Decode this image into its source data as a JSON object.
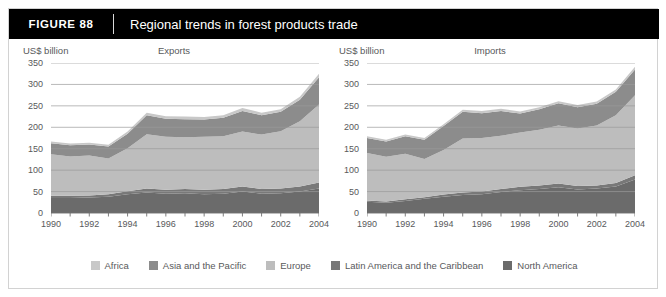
{
  "figure": {
    "number_label": "FIGURE  88",
    "title": "Regional trends in forest products trade"
  },
  "legend": {
    "items": [
      {
        "label": "Africa",
        "color": "#c8c8c8"
      },
      {
        "label": "Asia and the Pacific",
        "color": "#8c8c8c"
      },
      {
        "label": "Europe",
        "color": "#bdbdbd"
      },
      {
        "label": "Latin America and the Caribbean",
        "color": "#787878"
      },
      {
        "label": "North America",
        "color": "#6b6b6b"
      }
    ]
  },
  "chart_data": [
    {
      "type": "area",
      "title": "Exports",
      "ylabel": "US$ billion",
      "xlabel": "",
      "unit_label": "US$ billion",
      "grid": true,
      "legend_position": "bottom",
      "ylim": [
        0,
        350
      ],
      "yticks": [
        0,
        50,
        100,
        150,
        200,
        250,
        300,
        350
      ],
      "x": [
        1990,
        1991,
        1992,
        1993,
        1994,
        1995,
        1996,
        1997,
        1998,
        1999,
        2000,
        2001,
        2002,
        2003,
        2004
      ],
      "xtick_labels": [
        "1990",
        "1992",
        "1994",
        "1996",
        "1998",
        "2000",
        "2002",
        "2004"
      ],
      "stacked": true,
      "series": [
        {
          "name": "North America",
          "values": [
            35,
            35,
            36,
            38,
            44,
            48,
            45,
            46,
            44,
            45,
            50,
            45,
            46,
            50,
            57
          ]
        },
        {
          "name": "Latin America and the Caribbean",
          "values": [
            5,
            5,
            5,
            6,
            7,
            9,
            9,
            10,
            10,
            11,
            12,
            11,
            11,
            12,
            14
          ]
        },
        {
          "name": "Europe",
          "values": [
            97,
            92,
            93,
            83,
            100,
            127,
            124,
            121,
            124,
            123,
            128,
            127,
            134,
            152,
            182
          ]
        },
        {
          "name": "Asia and the Pacific",
          "values": [
            26,
            26,
            26,
            28,
            34,
            44,
            42,
            42,
            40,
            43,
            48,
            45,
            45,
            50,
            64
          ]
        },
        {
          "name": "Africa",
          "values": [
            4,
            4,
            4,
            4,
            5,
            6,
            6,
            6,
            6,
            6,
            7,
            6,
            6,
            7,
            8
          ]
        }
      ],
      "totals": [
        167,
        162,
        164,
        159,
        190,
        234,
        226,
        225,
        224,
        228,
        245,
        234,
        242,
        271,
        325
      ]
    },
    {
      "type": "area",
      "title": "Imports",
      "ylabel": "US$ billion",
      "xlabel": "",
      "unit_label": "US$ billion",
      "grid": true,
      "legend_position": "bottom",
      "ylim": [
        0,
        350
      ],
      "yticks": [
        0,
        50,
        100,
        150,
        200,
        250,
        300,
        350
      ],
      "x": [
        1990,
        1991,
        1992,
        1993,
        1994,
        1995,
        1996,
        1997,
        1998,
        1999,
        2000,
        2001,
        2002,
        2003,
        2004
      ],
      "xtick_labels": [
        "1990",
        "1992",
        "1994",
        "1996",
        "1998",
        "2000",
        "2002",
        "2004"
      ],
      "stacked": true,
      "series": [
        {
          "name": "North America",
          "values": [
            26,
            24,
            28,
            33,
            38,
            42,
            44,
            49,
            53,
            56,
            60,
            55,
            57,
            62,
            78
          ]
        },
        {
          "name": "Latin America and the Caribbean",
          "values": [
            3,
            3,
            4,
            4,
            5,
            6,
            6,
            7,
            8,
            8,
            9,
            8,
            7,
            8,
            10
          ]
        },
        {
          "name": "Europe",
          "values": [
            111,
            104,
            106,
            89,
            104,
            126,
            125,
            124,
            127,
            130,
            135,
            134,
            140,
            158,
            187
          ]
        },
        {
          "name": "Asia and the Pacific",
          "values": [
            35,
            36,
            41,
            45,
            56,
            62,
            58,
            58,
            44,
            48,
            52,
            50,
            51,
            55,
            60
          ]
        },
        {
          "name": "Africa",
          "values": [
            4,
            4,
            4,
            4,
            4,
            5,
            5,
            5,
            5,
            5,
            5,
            5,
            5,
            5,
            6
          ]
        }
      ],
      "totals": [
        179,
        171,
        183,
        175,
        207,
        241,
        238,
        243,
        237,
        247,
        261,
        252,
        260,
        288,
        341
      ]
    }
  ]
}
